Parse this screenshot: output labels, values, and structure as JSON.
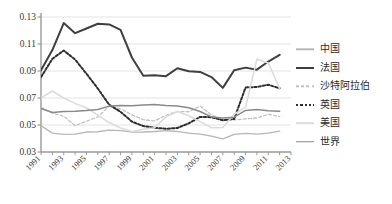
{
  "chart_data": {
    "type": "line",
    "title": "",
    "xlabel": "",
    "ylabel": "",
    "x": [
      1991,
      1992,
      1993,
      1994,
      1995,
      1996,
      1997,
      1998,
      1999,
      2000,
      2001,
      2002,
      2003,
      2004,
      2005,
      2006,
      2007,
      2008,
      2009,
      2010,
      2011,
      2012
    ],
    "xlim": [
      1991,
      2013
    ],
    "ylim": [
      0.03,
      0.13
    ],
    "yticks": [
      "0.03",
      "0.05",
      "0.07",
      "0.09",
      "0.11",
      "0.13"
    ],
    "ytick_values": [
      0.03,
      0.05,
      0.07,
      0.09,
      0.11,
      0.13
    ],
    "xticks": [
      "1991",
      "1993",
      "1995",
      "1997",
      "1999",
      "2001",
      "2003",
      "2005",
      "2007",
      "2009",
      "2011",
      "2013"
    ],
    "xtick_values": [
      1991,
      1993,
      1995,
      1997,
      1999,
      2001,
      2003,
      2005,
      2007,
      2009,
      2011,
      2013
    ],
    "grid": "horizontal",
    "legend_position": "right",
    "series": [
      {
        "name": "中国",
        "style": "solid",
        "color": "#b6b6b6",
        "width": 1.3,
        "values": [
          0.0495,
          0.044,
          0.043,
          0.0432,
          0.0448,
          0.045,
          0.0462,
          0.0458,
          0.0447,
          0.0448,
          0.0452,
          0.0458,
          0.0452,
          0.044,
          0.0432,
          0.0418,
          0.0398,
          0.043,
          0.0438,
          0.0432,
          0.044,
          0.0455
        ]
      },
      {
        "name": "法国",
        "style": "solid",
        "color": "#3f3f3f",
        "width": 2.0,
        "values": [
          0.0905,
          0.1055,
          0.1255,
          0.118,
          0.1215,
          0.125,
          0.1245,
          0.1205,
          0.1,
          0.0865,
          0.0868,
          0.0862,
          0.092,
          0.0898,
          0.0893,
          0.0855,
          0.0775,
          0.0905,
          0.0925,
          0.091,
          0.097,
          0.102
        ]
      },
      {
        "name": "沙特阿拉伯",
        "style": "dashed-light",
        "color": "#c2c2c2",
        "width": 1.3,
        "values": [
          0.0632,
          0.0588,
          0.0565,
          0.0495,
          0.0528,
          0.056,
          0.064,
          0.062,
          0.0575,
          0.054,
          0.053,
          0.0572,
          0.06,
          0.0598,
          0.064,
          0.0575,
          0.054,
          0.0538,
          0.0545,
          0.0552,
          0.058,
          0.0562
        ]
      },
      {
        "name": "英国",
        "style": "dashed-dark",
        "color": "#2e2e2e",
        "width": 2.0,
        "values": [
          0.0855,
          0.099,
          0.1052,
          0.0985,
          0.088,
          0.077,
          0.065,
          0.0598,
          0.0525,
          0.0492,
          0.048,
          0.0472,
          0.0478,
          0.0512,
          0.056,
          0.0558,
          0.0535,
          0.0545,
          0.0778,
          0.0782,
          0.0798,
          0.0772
        ]
      },
      {
        "name": "美国",
        "style": "solid",
        "color": "#dcdcdc",
        "width": 1.6,
        "values": [
          0.07,
          0.0752,
          0.07,
          0.066,
          0.0628,
          0.0572,
          0.0518,
          0.0478,
          0.0452,
          0.0468,
          0.048,
          0.056,
          0.06,
          0.0568,
          0.0525,
          0.048,
          0.0482,
          0.058,
          0.0632,
          0.0988,
          0.096,
          0.0772
        ]
      },
      {
        "name": "世界",
        "style": "solid",
        "color": "#8a8a8a",
        "width": 1.5,
        "values": [
          0.0622,
          0.0592,
          0.06,
          0.0602,
          0.0608,
          0.0615,
          0.064,
          0.0645,
          0.0642,
          0.0648,
          0.0652,
          0.0645,
          0.064,
          0.0628,
          0.06,
          0.056,
          0.0552,
          0.0558,
          0.0608,
          0.0615,
          0.0605,
          0.0602
        ]
      }
    ]
  },
  "legend": {
    "items": [
      {
        "label": "中国"
      },
      {
        "label": "法国"
      },
      {
        "label": "沙特阿拉伯"
      },
      {
        "label": "英国"
      },
      {
        "label": "美国"
      },
      {
        "label": "世界"
      }
    ]
  }
}
